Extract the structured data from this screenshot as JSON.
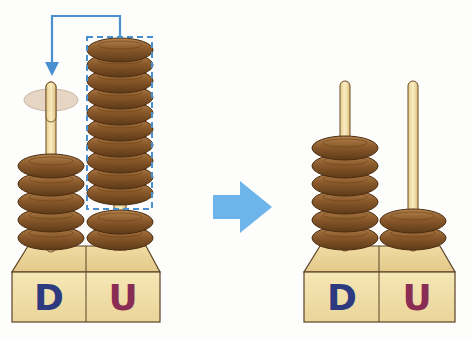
{
  "colors": {
    "background": "#fdfdfc",
    "bead": "#8a5a2b",
    "bead_dark": "#5e3a18",
    "bead_light": "#b5834e",
    "ghost_bead": "#c9ab88",
    "rod": "#f1dfa7",
    "rod_outline": "#6b4a22",
    "base": "#f3e2a9",
    "base_top": "#ead29a",
    "base_outline": "#5a4326",
    "arrow": "#4a9ad8",
    "big_arrow": "#6cb4ea",
    "dashed_box": "#4a8fd0",
    "label_d": "#2e3a80",
    "label_u": "#8a2d55"
  },
  "before": {
    "name": "Abacus before regrouping",
    "columns": [
      {
        "label": "D",
        "beads": 5,
        "ghost_beads": 1
      },
      {
        "label": "U",
        "beads": 12,
        "grouped_beads": 10
      }
    ],
    "move_arrow": "10 U beads moved as 1 D bead"
  },
  "transition_arrow": "right-arrow",
  "after": {
    "name": "Abacus after regrouping",
    "columns": [
      {
        "label": "D",
        "beads": 6
      },
      {
        "label": "U",
        "beads": 2
      }
    ]
  }
}
